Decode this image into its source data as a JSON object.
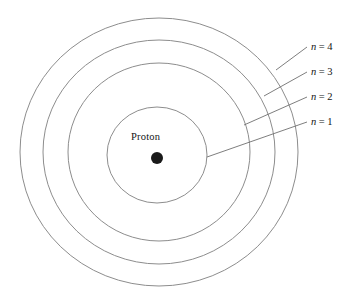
{
  "figure": {
    "kind": "bohr-model-hydrogen-diagram",
    "background_color": "#ffffff",
    "ring_stroke_color": "#8d8d8d",
    "leader_stroke_color": "#6f6f6f",
    "nucleus_color": "#1a1a1a",
    "text_color": "#141414"
  },
  "nucleus": {
    "label": "Proton",
    "dot_radius": 6,
    "center_x": 157,
    "center_y": 158
  },
  "shells": [
    {
      "id": "shell-1",
      "label_variable": "n",
      "label_equals": "=",
      "label_value": "1",
      "label_full": "n = 1",
      "rx": 50,
      "ry": 48,
      "label_x": 311,
      "label_y": 117,
      "leader_start_x": 207,
      "leader_start_y": 157,
      "leader_end_x": 307,
      "leader_end_y": 122
    },
    {
      "id": "shell-2",
      "label_variable": "n",
      "label_equals": "=",
      "label_value": "2",
      "label_full": "n = 2",
      "rx": 91,
      "ry": 89,
      "label_x": 311,
      "label_y": 92,
      "leader_start_x": 244,
      "leader_start_y": 125,
      "leader_end_x": 307,
      "leader_end_y": 97
    },
    {
      "id": "shell-3",
      "label_variable": "n",
      "label_equals": "=",
      "label_value": "3",
      "label_full": "n = 3",
      "rx": 116,
      "ry": 112,
      "label_x": 311,
      "label_y": 67,
      "leader_start_x": 264,
      "leader_start_y": 96,
      "leader_end_x": 307,
      "leader_end_y": 72
    },
    {
      "id": "shell-4",
      "label_variable": "n",
      "label_equals": "=",
      "label_value": "4",
      "label_full": "n = 4",
      "rx": 139,
      "ry": 134,
      "label_x": 311,
      "label_y": 42,
      "leader_start_x": 276,
      "leader_start_y": 70,
      "leader_end_x": 307,
      "leader_end_y": 47
    }
  ],
  "center": {
    "x": 159,
    "y": 152
  }
}
